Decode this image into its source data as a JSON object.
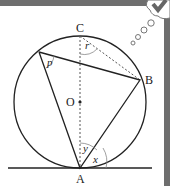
{
  "diagram": {
    "points": {
      "C": "C",
      "B": "B",
      "O": "O",
      "A": "A"
    },
    "angles": {
      "p": "p",
      "r": "r",
      "y": "y",
      "x": "x"
    },
    "decoration": "thought-bubble-check-icon"
  }
}
